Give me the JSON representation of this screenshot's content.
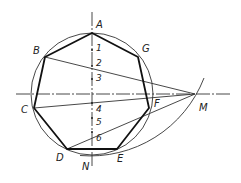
{
  "figure": {
    "points": {
      "A": {
        "label": "A",
        "x": 92,
        "y": 33
      },
      "B": {
        "label": "B",
        "x": 45,
        "y": 57
      },
      "C": {
        "label": "C",
        "x": 34,
        "y": 108
      },
      "D": {
        "label": "D",
        "x": 67,
        "y": 149
      },
      "E": {
        "label": "E",
        "x": 117,
        "y": 149
      },
      "F": {
        "label": "F",
        "x": 149,
        "y": 108
      },
      "G": {
        "label": "G",
        "x": 138,
        "y": 57
      },
      "M": {
        "label": "M",
        "x": 195,
        "y": 94
      },
      "N": {
        "label": "N",
        "x": 92,
        "y": 155
      }
    },
    "divisions": [
      "1",
      "2",
      "3",
      "4",
      "5",
      "6"
    ],
    "colors": {
      "line": "#222222",
      "background": "#ffffff"
    }
  }
}
